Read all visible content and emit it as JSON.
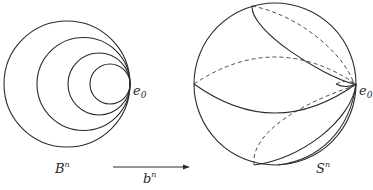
{
  "figure": {
    "left_panel": {
      "label": "B",
      "label_sup": "n",
      "point_label": "e",
      "point_sub": "0",
      "circles": [
        {
          "cx": 67,
          "cy": 84,
          "r": 63
        },
        {
          "cx": 83.5,
          "cy": 84,
          "r": 46.5
        },
        {
          "cx": 99,
          "cy": 84,
          "r": 31
        },
        {
          "cx": 110,
          "cy": 84,
          "r": 20
        }
      ]
    },
    "arrow": {
      "label": "b",
      "label_sup": "n"
    },
    "right_panel": {
      "label": "S",
      "label_sup": "n",
      "point_label": "e",
      "point_sub": "0",
      "sphere": {
        "cx": 275,
        "cy": 84,
        "r": 81
      }
    }
  }
}
